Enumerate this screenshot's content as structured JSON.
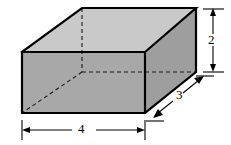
{
  "figure": {
    "name": "rectangular-prism-with-dimensions",
    "background_color": "#ffffff",
    "solid": {
      "type": "rectangular prism",
      "top_face_color": "#c9c9c9",
      "front_face_color": "#a8a8a8",
      "side_face_color": "#9e9e9e",
      "edge_color": "#000000",
      "hidden_edge_style": "dashed"
    },
    "dimensions": {
      "height": "2",
      "depth": "3",
      "width": "4"
    },
    "geometry": {
      "front_top_left": [
        22,
        52
      ],
      "front_top_right": [
        145,
        52
      ],
      "front_bottom_left": [
        22,
        113
      ],
      "front_bottom_right": [
        145,
        113
      ],
      "rear_top_left": [
        82,
        8
      ],
      "rear_top_right": [
        196,
        8
      ],
      "rear_bottom_right": [
        196,
        72
      ],
      "hidden_vertex": [
        82,
        72
      ]
    }
  }
}
